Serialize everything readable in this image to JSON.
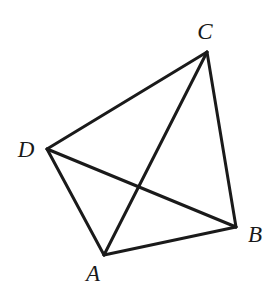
{
  "figure": {
    "type": "geometry-diagram",
    "background_color": "#ffffff",
    "stroke_color": "#1a1a1a",
    "stroke_width": 3,
    "label_color": "#191919",
    "width": 275,
    "height": 293
  },
  "labels": {
    "a": "A",
    "b": "B",
    "c": "C",
    "d": "D"
  },
  "chart_data": {
    "type": "diagram",
    "title": "",
    "shape": "quadrilateral with both diagonals",
    "points": [
      {
        "name": "A",
        "x": 104,
        "y": 255,
        "label": "A",
        "label_x": 93,
        "label_y": 273
      },
      {
        "name": "B",
        "x": 236,
        "y": 227,
        "label": "B",
        "label_x": 255,
        "label_y": 234
      },
      {
        "name": "C",
        "x": 207,
        "y": 52,
        "label": "C",
        "label_x": 205,
        "label_y": 31
      },
      {
        "name": "D",
        "x": 47,
        "y": 149,
        "label": "D",
        "label_x": 26,
        "label_y": 149
      }
    ],
    "edges": [
      {
        "name": "DC",
        "from": "D",
        "to": "C",
        "kind": "side"
      },
      {
        "name": "CB",
        "from": "C",
        "to": "B",
        "kind": "side"
      },
      {
        "name": "BA",
        "from": "B",
        "to": "A",
        "kind": "side"
      },
      {
        "name": "AD",
        "from": "A",
        "to": "D",
        "kind": "side"
      },
      {
        "name": "AC",
        "from": "A",
        "to": "C",
        "kind": "diagonal"
      },
      {
        "name": "DB",
        "from": "D",
        "to": "B",
        "kind": "diagonal"
      }
    ],
    "intersections": [
      {
        "name": "diagonal-crossing",
        "of": [
          "AC",
          "DB"
        ],
        "x": 143,
        "y": 191
      }
    ]
  }
}
